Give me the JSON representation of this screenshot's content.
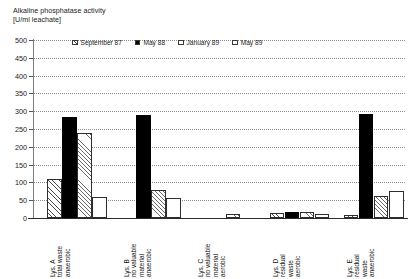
{
  "chart_data": {
    "type": "bar",
    "title": "Alkaline phosphatase activity",
    "subtitle": "[U/ml leachate]",
    "ylabel": "",
    "xlabel": "",
    "ylim": [
      0,
      500
    ],
    "yticks": [
      0,
      50,
      100,
      150,
      200,
      250,
      300,
      350,
      400,
      450,
      500
    ],
    "grid": true,
    "legend_position": "top-inside",
    "categories": [
      "Lys. A\ntotal waste\nanaerobic",
      "Lys. B\nno valuable material\nanaerobic",
      "Lys. C\nno valuable material\naerobic",
      "Lys. D\nresidual waste\naerobic",
      "Lys. E\nresidual waste\nanaerobic"
    ],
    "category_lines": [
      [
        "Lys. A",
        "total waste",
        "anaerobic"
      ],
      [
        "Lys. B",
        "no valuable",
        "material",
        "anaerobic"
      ],
      [
        "Lys. C",
        "no valuable",
        "material",
        "aerobic"
      ],
      [
        "Lys. D",
        "residual",
        "waste",
        "aerobic"
      ],
      [
        "Lys. E",
        "residual",
        "waste",
        "anaerobic"
      ]
    ],
    "series": [
      {
        "name": "September 87",
        "pattern": "diagonal-hatch",
        "values": [
          110,
          0,
          0,
          14,
          8
        ]
      },
      {
        "name": "May 88",
        "pattern": "solid-black",
        "values": [
          285,
          290,
          0,
          18,
          293
        ]
      },
      {
        "name": "January 89",
        "pattern": "diagonal-hatch-light",
        "values": [
          238,
          78,
          10,
          16,
          62
        ]
      },
      {
        "name": "May 89",
        "pattern": "stipple",
        "values": [
          58,
          55,
          0,
          12,
          75
        ]
      }
    ]
  },
  "legend": {
    "items": [
      {
        "label": "September 87"
      },
      {
        "label": "May 88"
      },
      {
        "label": "January 89"
      },
      {
        "label": "May 89"
      }
    ]
  },
  "axis": {
    "y_tick_labels": [
      "500",
      "450",
      "400",
      "350",
      "300",
      "250",
      "200",
      "150",
      "100",
      "50",
      "0"
    ]
  }
}
